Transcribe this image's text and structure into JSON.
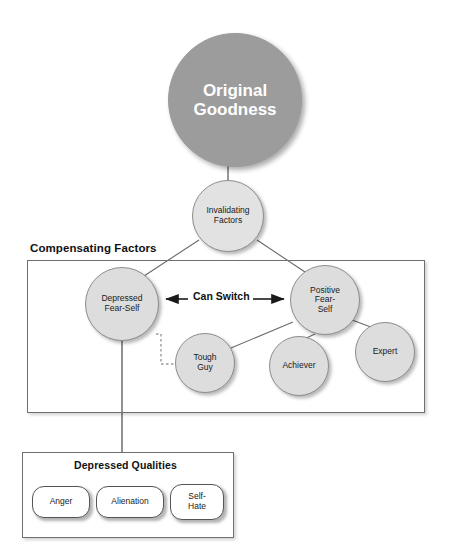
{
  "diagram": {
    "background_color": "#ffffff",
    "root": {
      "id": "original-goodness",
      "label": "Original\nGoodness",
      "shape": "circle",
      "fill": "#9c9c9c",
      "text_color": "#ffffff"
    },
    "invalidating": {
      "id": "invalidating-factors",
      "label": "Invalidating\nFactors",
      "shape": "ellipse",
      "fill": "#e2e2e2",
      "text_color": "#1a1a1a"
    },
    "groups": {
      "compensating": {
        "title": "Compensating Factors",
        "border_color": "#6f6f6f"
      },
      "qualities": {
        "title": "Depressed Qualities",
        "border_color": "#6f6f6f"
      }
    },
    "switch_label": "Can Switch",
    "compensating_nodes": [
      {
        "id": "depressed-fear-self",
        "label": "Depressed\nFear-Self",
        "shape": "circle",
        "fill": "#dddddd"
      },
      {
        "id": "positive-fear-self",
        "label": "Positive\nFear-\nSelf",
        "shape": "circle",
        "fill": "#dddddd"
      },
      {
        "id": "tough-guy",
        "label": "Tough\nGuy",
        "shape": "circle",
        "fill": "#dddddd"
      },
      {
        "id": "achiever",
        "label": "Achiever",
        "shape": "circle",
        "fill": "#dddddd"
      },
      {
        "id": "expert",
        "label": "Expert",
        "shape": "circle",
        "fill": "#dddddd"
      }
    ],
    "depressed_qualities": [
      {
        "id": "anger",
        "label": "Anger",
        "shape": "pill",
        "fill": "#ffffff"
      },
      {
        "id": "alienation",
        "label": "Alienation",
        "shape": "pill",
        "fill": "#ffffff"
      },
      {
        "id": "self-hate",
        "label": "Self-\nHate",
        "shape": "pill",
        "fill": "#ffffff"
      }
    ],
    "edges": [
      {
        "from": "original-goodness",
        "to": "invalidating-factors",
        "style": "solid"
      },
      {
        "from": "invalidating-factors",
        "to": "depressed-fear-self",
        "style": "solid"
      },
      {
        "from": "invalidating-factors",
        "to": "positive-fear-self",
        "style": "solid"
      },
      {
        "from": "depressed-fear-self",
        "to": "positive-fear-self",
        "style": "double-arrow",
        "label": "Can Switch"
      },
      {
        "from": "depressed-fear-self",
        "to": "tough-guy",
        "style": "dotted"
      },
      {
        "from": "positive-fear-self",
        "to": "tough-guy",
        "style": "solid"
      },
      {
        "from": "positive-fear-self",
        "to": "achiever",
        "style": "solid"
      },
      {
        "from": "positive-fear-self",
        "to": "expert",
        "style": "solid"
      },
      {
        "from": "depressed-fear-self",
        "to": "depressed-qualities",
        "style": "solid"
      }
    ]
  }
}
